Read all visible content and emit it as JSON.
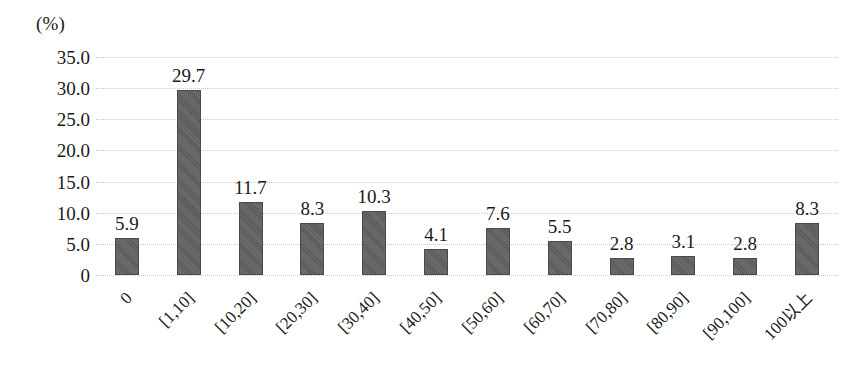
{
  "chart_data": {
    "type": "bar",
    "title": "",
    "subtitle": "",
    "unit_label": "(%)",
    "xlabel": "",
    "ylabel": "",
    "ylim": [
      0,
      35
    ],
    "ytick_labels": [
      "0",
      "5.0",
      "10.0",
      "15.0",
      "20.0",
      "25.0",
      "30.0",
      "35.0"
    ],
    "ytick_values": [
      0,
      5,
      10,
      15,
      20,
      25,
      30,
      35
    ],
    "grid": true,
    "grid_axis": "y",
    "legend": "none",
    "bar_color": "#5f5f5f",
    "grid_color": "#c9c9c9",
    "text_color": "#1a1a1a",
    "categories": [
      "0",
      "[1,10]",
      "[10,20]",
      "[20,30]",
      "[30,40]",
      "[40,50]",
      "[50,60]",
      "[60,70]",
      "[70,80]",
      "[80,90]",
      "[90,100]",
      "100以上"
    ],
    "values": [
      5.9,
      29.7,
      11.7,
      8.3,
      10.3,
      4.1,
      7.6,
      5.5,
      2.8,
      3.1,
      2.8,
      8.3
    ],
    "value_labels": [
      "5.9",
      "29.7",
      "11.7",
      "8.3",
      "10.3",
      "4.1",
      "7.6",
      "5.5",
      "2.8",
      "3.1",
      "2.8",
      "8.3"
    ]
  }
}
